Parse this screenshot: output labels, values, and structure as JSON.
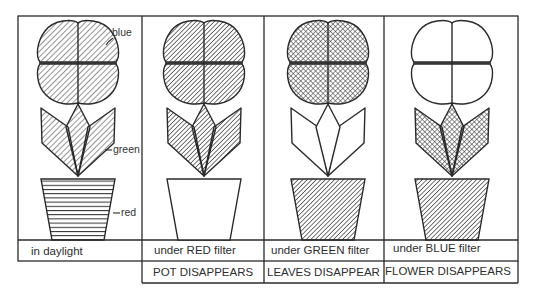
{
  "legend": {
    "flower_color": "blue",
    "leaves_color": "green",
    "pot_color": "red"
  },
  "panels": [
    {
      "caption": "in daylight",
      "result": "",
      "flower": "diagonal-hatch",
      "leaves": "diagonal-hatch",
      "pot": "horizontal-lines"
    },
    {
      "caption": "under RED filter",
      "result": "POT DISAPPEARS",
      "flower": "dark-hatch",
      "leaves": "dark-hatch",
      "pot": "blank"
    },
    {
      "caption": "under GREEN filter",
      "result": "LEAVES DISAPPEAR",
      "flower": "cross-hatch",
      "leaves": "blank",
      "pot": "dark-hatch"
    },
    {
      "caption": "under BLUE filter",
      "result": "FLOWER DISAPPEARS",
      "flower": "blank",
      "leaves": "cross-hatch",
      "pot": "dark-hatch"
    }
  ],
  "colors": {
    "ink": "#2a2a2a",
    "paper": "#ffffff"
  }
}
